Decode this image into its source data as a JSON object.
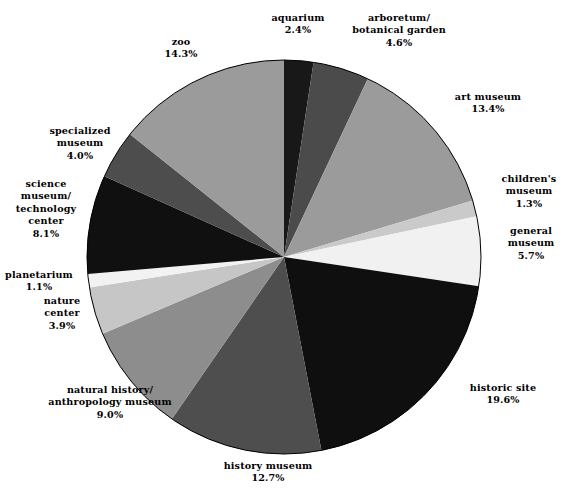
{
  "chart_data": {
    "type": "pie",
    "title": "",
    "subtitle": "",
    "xlabel": "",
    "ylabel": "",
    "legend_position": "none",
    "grid": false,
    "start_angle_deg": 0,
    "direction": "clockwise",
    "value_unit": "percent",
    "categories": [
      "aquarium",
      "arboretum/ botanical garden",
      "art museum",
      "children's museum",
      "general museum",
      "historic site",
      "history museum",
      "natural history/ anthropology museum",
      "nature center",
      "planetarium",
      "science museum/ technology center",
      "specialized museum",
      "zoo"
    ],
    "values": [
      2.4,
      4.6,
      13.4,
      1.3,
      5.7,
      19.6,
      12.7,
      9.0,
      3.9,
      1.1,
      8.1,
      4.0,
      14.3
    ],
    "slices": [
      {
        "name": "aquarium",
        "label_lines": [
          "aquarium"
        ],
        "value": 2.4,
        "value_text": "2.4%",
        "color": "#181818",
        "label_x": 298,
        "label_y": 24
      },
      {
        "name": "arboretum-botanical-garden",
        "label_lines": [
          "arboretum/",
          "botanical garden"
        ],
        "value": 4.6,
        "value_text": "4.6%",
        "color": "#4b4b4b",
        "label_x": 399,
        "label_y": 31
      },
      {
        "name": "art-museum",
        "label_lines": [
          "art museum"
        ],
        "value": 13.4,
        "value_text": "13.4%",
        "color": "#9b9b9b",
        "label_x": 488,
        "label_y": 103
      },
      {
        "name": "childrens-museum",
        "label_lines": [
          "children's",
          "museum"
        ],
        "value": 1.3,
        "value_text": "1.3%",
        "color": "#cacaca",
        "label_x": 529,
        "label_y": 192
      },
      {
        "name": "general-museum",
        "label_lines": [
          "general",
          "museum"
        ],
        "value": 5.7,
        "value_text": "5.7%",
        "color": "#f1f1f1",
        "label_x": 531,
        "label_y": 244
      },
      {
        "name": "historic-site",
        "label_lines": [
          "historic site"
        ],
        "value": 19.6,
        "value_text": "19.6%",
        "color": "#0f0f0f",
        "label_x": 503,
        "label_y": 394
      },
      {
        "name": "history-museum",
        "label_lines": [
          "history museum"
        ],
        "value": 12.7,
        "value_text": "12.7%",
        "color": "#4e4e4e",
        "label_x": 268,
        "label_y": 472
      },
      {
        "name": "natural-history-anthropology-museum",
        "label_lines": [
          "natural history/",
          "anthropology museum"
        ],
        "value": 9.0,
        "value_text": "9.0%",
        "color": "#8d8d8d",
        "label_x": 110,
        "label_y": 403
      },
      {
        "name": "nature-center",
        "label_lines": [
          "nature",
          "center"
        ],
        "value": 3.9,
        "value_text": "3.9%",
        "color": "#c6c6c6",
        "label_x": 62,
        "label_y": 314
      },
      {
        "name": "planetarium",
        "label_lines": [
          "planetarium"
        ],
        "value": 1.1,
        "value_text": "1.1%",
        "color": "#f2f2f2",
        "label_x": 39,
        "label_y": 281
      },
      {
        "name": "science-museum-technology-center",
        "label_lines": [
          "science",
          "museum/",
          "technology",
          "center"
        ],
        "value": 8.1,
        "value_text": "8.1%",
        "color": "#101010",
        "label_x": 46,
        "label_y": 209
      },
      {
        "name": "specialized-museum",
        "label_lines": [
          "specialized",
          "museum"
        ],
        "value": 4.0,
        "value_text": "4.0%",
        "color": "#4d4d4d",
        "label_x": 80,
        "label_y": 144
      },
      {
        "name": "zoo",
        "label_lines": [
          "zoo"
        ],
        "value": 14.3,
        "value_text": "14.3%",
        "color": "#9b9b9b",
        "label_x": 181,
        "label_y": 48
      }
    ],
    "geometry": {
      "center_x": 284,
      "center_y": 257,
      "radius": 197
    },
    "colors": {
      "background": "#ffffff",
      "text": "#000000",
      "outline": "#000000"
    }
  }
}
